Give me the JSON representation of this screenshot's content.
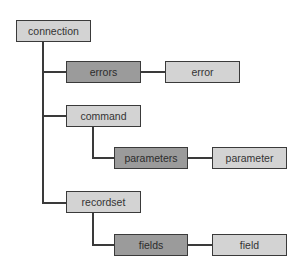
{
  "diagram": {
    "colors": {
      "object_fill": "#d3d3d3",
      "collection_fill": "#9b9b9b",
      "border": "#3a3a3a",
      "text": "#333333"
    },
    "nodes": {
      "connection": {
        "label": "connection",
        "type": "object"
      },
      "errors": {
        "label": "errors",
        "type": "collection"
      },
      "error": {
        "label": "error",
        "type": "object"
      },
      "command": {
        "label": "command",
        "type": "object"
      },
      "parameters": {
        "label": "parameters",
        "type": "collection"
      },
      "parameter": {
        "label": "parameter",
        "type": "object"
      },
      "recordset": {
        "label": "recordset",
        "type": "object"
      },
      "fields": {
        "label": "fields",
        "type": "collection"
      },
      "field": {
        "label": "field",
        "type": "object"
      }
    },
    "edges": [
      [
        "connection",
        "errors"
      ],
      [
        "errors",
        "error"
      ],
      [
        "connection",
        "command"
      ],
      [
        "command",
        "parameters"
      ],
      [
        "parameters",
        "parameter"
      ],
      [
        "connection",
        "recordset"
      ],
      [
        "recordset",
        "fields"
      ],
      [
        "fields",
        "field"
      ]
    ]
  }
}
